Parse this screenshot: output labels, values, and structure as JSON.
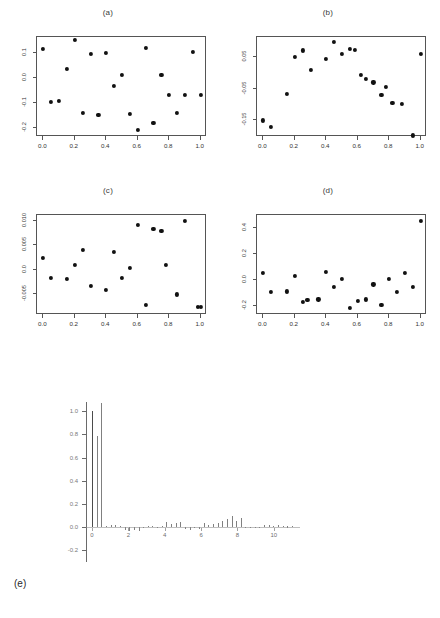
{
  "figure": {
    "width": 440,
    "height": 618,
    "background": "#ffffff",
    "ink_color": "#111111",
    "axis_color": "#555555"
  },
  "panels": [
    {
      "id": "a",
      "title": "(a)",
      "xlabel": "",
      "ylabel": "",
      "xticks": [
        "0.0",
        "0.2",
        "0.4",
        "0.6",
        "0.8",
        "1.0"
      ],
      "xtick_values": [
        0.0,
        0.2,
        0.4,
        0.6,
        0.8,
        1.0
      ],
      "yticks": [
        "0.1",
        "0.0",
        "-0.1",
        "-0.2"
      ],
      "ytick_values": [
        0.1,
        0.0,
        -0.1,
        -0.2
      ],
      "xlim": [
        -0.04,
        1.04
      ],
      "ylim": [
        -0.235,
        0.165
      ]
    },
    {
      "id": "b",
      "title": "(b)",
      "xlabel": "",
      "ylabel": "",
      "xticks": [
        "0.0",
        "0.2",
        "0.4",
        "0.6",
        "0.8",
        "1.0"
      ],
      "xtick_values": [
        0.0,
        0.2,
        0.4,
        0.6,
        0.8,
        1.0
      ],
      "yticks": [
        "0.05",
        "-0.05",
        "-0.15"
      ],
      "ytick_values": [
        0.05,
        -0.05,
        -0.15
      ],
      "xlim": [
        -0.04,
        1.04
      ],
      "ylim": [
        -0.205,
        0.115
      ]
    },
    {
      "id": "c",
      "title": "(c)",
      "xlabel": "",
      "ylabel": "",
      "xticks": [
        "0.0",
        "0.2",
        "0.4",
        "0.6",
        "0.8",
        "1.0"
      ],
      "xtick_values": [
        0.0,
        0.2,
        0.4,
        0.6,
        0.8,
        1.0
      ],
      "yticks": [
        "0.010",
        "0.005",
        "0.0",
        "-0.005"
      ],
      "ytick_values": [
        0.01,
        0.005,
        0.0,
        -0.005
      ],
      "xlim": [
        -0.04,
        1.04
      ],
      "ylim": [
        -0.0092,
        0.0112
      ]
    },
    {
      "id": "d",
      "title": "(d)",
      "xlabel": "",
      "ylabel": "",
      "xticks": [
        "0.0",
        "0.2",
        "0.4",
        "0.6",
        "0.8",
        "1.0"
      ],
      "xtick_values": [
        0.0,
        0.2,
        0.4,
        0.6,
        0.8,
        1.0
      ],
      "yticks": [
        "0.4",
        "0.2",
        "0.0",
        "-0.2"
      ],
      "ytick_values": [
        0.4,
        0.2,
        0.0,
        -0.2
      ],
      "xlim": [
        -0.04,
        1.04
      ],
      "ylim": [
        -0.27,
        0.5
      ]
    }
  ],
  "bottom_panel": {
    "id": "e",
    "label": "(e)",
    "yticks": [
      "1.0",
      "0.8",
      "0.6",
      "0.4",
      "0.2",
      "0.0",
      "-0.2"
    ],
    "ytick_values": [
      1.0,
      0.8,
      0.6,
      0.4,
      0.2,
      0.0,
      -0.2
    ],
    "xticks": [
      "0",
      "2",
      "4",
      "6",
      "8",
      "10"
    ],
    "xtick_values": [
      0,
      2,
      4,
      6,
      8,
      10
    ],
    "ylim": [
      -0.3,
      1.08
    ],
    "xlim": [
      0,
      11
    ]
  },
  "chart_data": [
    {
      "type": "scatter",
      "panel": "a",
      "title": "(a)",
      "xlabel": "",
      "ylabel": "",
      "xlim": [
        -0.04,
        1.04
      ],
      "ylim": [
        -0.235,
        0.165
      ],
      "grid": false,
      "legend": "none",
      "x": [
        0.0,
        0.05,
        0.1,
        0.15,
        0.2,
        0.25,
        0.3,
        0.35,
        0.4,
        0.45,
        0.5,
        0.55,
        0.6,
        0.65,
        0.7,
        0.75,
        0.8,
        0.85,
        0.9,
        0.95,
        1.0
      ],
      "y": [
        0.118,
        -0.095,
        -0.092,
        0.038,
        0.152,
        -0.14,
        0.096,
        -0.148,
        0.1,
        -0.03,
        0.013,
        -0.142,
        -0.205,
        0.12,
        -0.178,
        0.013,
        -0.065,
        -0.14,
        -0.068,
        0.104,
        -0.068
      ]
    },
    {
      "type": "scatter",
      "panel": "b",
      "title": "(b)",
      "xlabel": "",
      "ylabel": "",
      "xlim": [
        -0.04,
        1.04
      ],
      "ylim": [
        -0.205,
        0.115
      ],
      "grid": false,
      "legend": "none",
      "x": [
        0.0,
        0.05,
        0.15,
        0.2,
        0.25,
        0.3,
        0.4,
        0.45,
        0.5,
        0.55,
        0.58,
        0.62,
        0.65,
        0.7,
        0.75,
        0.78,
        0.82,
        0.88,
        0.95,
        1.0
      ],
      "y": [
        -0.152,
        -0.172,
        -0.068,
        0.052,
        0.072,
        0.01,
        0.046,
        0.1,
        0.062,
        0.078,
        0.074,
        -0.005,
        -0.018,
        -0.03,
        -0.07,
        -0.044,
        -0.095,
        -0.098,
        -0.2,
        0.062
      ]
    },
    {
      "type": "scatter",
      "panel": "c",
      "title": "(c)",
      "xlabel": "",
      "ylabel": "",
      "xlim": [
        -0.04,
        1.04
      ],
      "ylim": [
        -0.0092,
        0.0112
      ],
      "grid": false,
      "legend": "none",
      "x": [
        0.0,
        0.05,
        0.15,
        0.2,
        0.25,
        0.3,
        0.4,
        0.45,
        0.5,
        0.55,
        0.6,
        0.65,
        0.7,
        0.75,
        0.78,
        0.85,
        0.9,
        0.98,
        1.0
      ],
      "y": [
        0.0024,
        -0.0016,
        -0.0018,
        0.001,
        0.004,
        -0.0032,
        -0.004,
        0.0036,
        -0.0017,
        0.0004,
        0.0092,
        -0.0072,
        0.0084,
        0.008,
        0.001,
        -0.005,
        0.01,
        -0.0076,
        -0.0076
      ]
    },
    {
      "type": "scatter",
      "panel": "d",
      "title": "(d)",
      "xlabel": "",
      "ylabel": "",
      "xlim": [
        -0.27,
        0.5
      ],
      "ylim": [
        -0.27,
        0.5
      ],
      "grid": false,
      "legend": "none",
      "x": [
        0.0,
        0.05,
        0.15,
        0.2,
        0.25,
        0.28,
        0.35,
        0.4,
        0.45,
        0.5,
        0.55,
        0.6,
        0.65,
        0.7,
        0.75,
        0.8,
        0.85,
        0.9,
        0.95,
        1.0
      ],
      "y": [
        0.055,
        -0.09,
        -0.088,
        0.03,
        -0.17,
        -0.155,
        -0.15,
        0.06,
        -0.055,
        0.01,
        -0.215,
        -0.16,
        -0.15,
        -0.035,
        -0.195,
        0.01,
        -0.09,
        0.055,
        -0.055,
        0.455
      ]
    },
    {
      "type": "bar",
      "panel": "e",
      "title": "",
      "xlabel": "",
      "ylabel": "",
      "xlim": [
        0,
        11
      ],
      "ylim": [
        -0.3,
        1.08
      ],
      "grid": false,
      "legend": "none",
      "note": "faint autocorrelation-style spike plot; near-zero lags",
      "categories": [
        "0",
        "1",
        "2",
        "3",
        "4",
        "5",
        "6",
        "7",
        "8",
        "9",
        "10"
      ],
      "values": [
        1.0,
        0.02,
        -0.03,
        0.01,
        0.04,
        -0.02,
        0.03,
        0.08,
        -0.01,
        0.02,
        0.01
      ]
    }
  ]
}
